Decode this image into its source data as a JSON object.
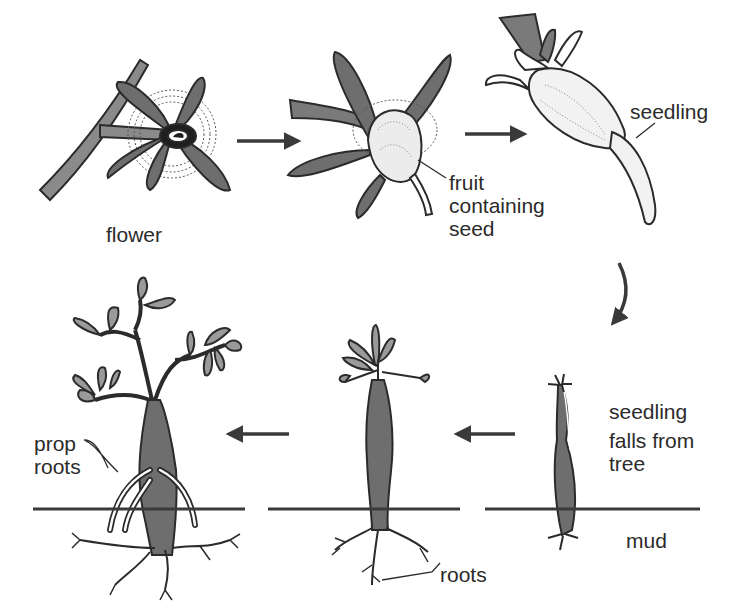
{
  "diagram": {
    "stages": [
      {
        "id": "flower",
        "label": "flower"
      },
      {
        "id": "fruit",
        "label_lines": [
          "fruit",
          "containing",
          "seed"
        ]
      },
      {
        "id": "seedling",
        "label": "seedling"
      },
      {
        "id": "falls",
        "label_lines": [
          "seedling",
          "falls from",
          "tree"
        ]
      },
      {
        "id": "young-tree",
        "label": "roots"
      },
      {
        "id": "mature-tree",
        "label_lines": [
          "prop",
          "roots"
        ]
      }
    ],
    "ground_label": "mud",
    "arrows": [
      {
        "from": "flower",
        "to": "fruit",
        "direction": "right"
      },
      {
        "from": "fruit",
        "to": "seedling",
        "direction": "right"
      },
      {
        "from": "seedling",
        "to": "falls",
        "direction": "down-curved"
      },
      {
        "from": "falls",
        "to": "young-tree",
        "direction": "left"
      },
      {
        "from": "young-tree",
        "to": "mature-tree",
        "direction": "left"
      }
    ],
    "colors": {
      "ink": "#2b2b2b",
      "fill_dark": "#6e6e6e",
      "fill_mid": "#9a9a9a",
      "fill_light": "#ececec"
    }
  }
}
